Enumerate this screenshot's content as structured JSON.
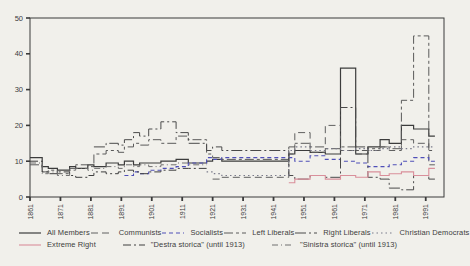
{
  "page": {
    "background": "#f1f0eb",
    "frame_color": "#3a3a3a",
    "tick_text_color": "#3d3d3d"
  },
  "chart_data": {
    "type": "line",
    "subtype": "step-after",
    "title": "",
    "xlabel": "",
    "ylabel": "",
    "xlim": [
      1861,
      1997
    ],
    "ylim": [
      0,
      50
    ],
    "x_ticks": [
      1861,
      1871,
      1881,
      1891,
      1901,
      1911,
      1921,
      1931,
      1941,
      1951,
      1961,
      1971,
      1981,
      1991
    ],
    "y_ticks": [
      0,
      10,
      20,
      30,
      40,
      50
    ],
    "grid": false,
    "legend_position": "bottom",
    "series": [
      {
        "name": "all-members",
        "label": "All Members",
        "color": "#3c3c3c",
        "dash": [],
        "width": 1.2,
        "points": [
          [
            1861,
            11
          ],
          [
            1865,
            8.5
          ],
          [
            1867,
            8
          ],
          [
            1870,
            7.5
          ],
          [
            1874,
            8.5
          ],
          [
            1876,
            8
          ],
          [
            1880,
            9
          ],
          [
            1882,
            8.5
          ],
          [
            1886,
            9.5
          ],
          [
            1890,
            9
          ],
          [
            1892,
            10
          ],
          [
            1895,
            9
          ],
          [
            1897,
            9.5
          ],
          [
            1900,
            9.5
          ],
          [
            1904,
            10
          ],
          [
            1909,
            10.5
          ],
          [
            1913,
            9.5
          ],
          [
            1919,
            10
          ],
          [
            1921,
            10.5
          ],
          [
            1924,
            10
          ],
          [
            1946,
            12
          ],
          [
            1948,
            13
          ],
          [
            1953,
            12.5
          ],
          [
            1958,
            12
          ],
          [
            1963,
            36
          ],
          [
            1968,
            12
          ],
          [
            1972,
            14
          ],
          [
            1976,
            16
          ],
          [
            1979,
            15
          ],
          [
            1983,
            20
          ],
          [
            1987,
            19
          ],
          [
            1992,
            17
          ],
          [
            1994,
            17
          ]
        ]
      },
      {
        "name": "communists",
        "label": "Communists",
        "color": "#606060",
        "dash": [
          7,
          4
        ],
        "width": 1,
        "points": [
          [
            1921,
            5
          ],
          [
            1924,
            5.5
          ],
          [
            1946,
            12
          ],
          [
            1948,
            18
          ],
          [
            1953,
            12.5
          ],
          [
            1958,
            20
          ],
          [
            1963,
            13
          ],
          [
            1968,
            12
          ],
          [
            1972,
            13
          ],
          [
            1976,
            14
          ],
          [
            1979,
            13
          ],
          [
            1983,
            16
          ],
          [
            1987,
            15
          ],
          [
            1992,
            9
          ],
          [
            1994,
            9
          ]
        ]
      },
      {
        "name": "socialists",
        "label": "Socialists",
        "color": "#4f4fb8",
        "dash": [
          4,
          3
        ],
        "width": 1.1,
        "points": [
          [
            1892,
            6
          ],
          [
            1895,
            7
          ],
          [
            1897,
            6.5
          ],
          [
            1900,
            7.5
          ],
          [
            1904,
            8
          ],
          [
            1909,
            8.5
          ],
          [
            1913,
            9.5
          ],
          [
            1919,
            11
          ],
          [
            1921,
            10.5
          ],
          [
            1924,
            11
          ],
          [
            1946,
            11
          ],
          [
            1948,
            10
          ],
          [
            1953,
            11.5
          ],
          [
            1958,
            10.5
          ],
          [
            1963,
            10
          ],
          [
            1968,
            9.5
          ],
          [
            1972,
            8.5
          ],
          [
            1976,
            8.5
          ],
          [
            1979,
            9
          ],
          [
            1983,
            10
          ],
          [
            1987,
            11
          ],
          [
            1992,
            10
          ],
          [
            1994,
            10
          ]
        ]
      },
      {
        "name": "left-liberals",
        "label": "Left Liberals",
        "color": "#5a5a5a",
        "dash": [
          9,
          3,
          3,
          3
        ],
        "width": 1,
        "points": [
          [
            1861,
            9
          ],
          [
            1865,
            7
          ],
          [
            1867,
            7.5
          ],
          [
            1870,
            6.5
          ],
          [
            1874,
            8
          ],
          [
            1876,
            9
          ],
          [
            1880,
            8.5
          ],
          [
            1882,
            12
          ],
          [
            1886,
            13
          ],
          [
            1890,
            12.5
          ],
          [
            1892,
            14
          ],
          [
            1895,
            15
          ],
          [
            1897,
            14.5
          ],
          [
            1900,
            16
          ],
          [
            1904,
            15
          ],
          [
            1909,
            17
          ],
          [
            1913,
            16
          ],
          [
            1919,
            12
          ],
          [
            1921,
            11
          ],
          [
            1924,
            10.5
          ],
          [
            1946,
            14
          ],
          [
            1948,
            15
          ],
          [
            1953,
            14
          ],
          [
            1958,
            13.5
          ],
          [
            1963,
            14
          ],
          [
            1968,
            13
          ],
          [
            1972,
            13.5
          ],
          [
            1976,
            14
          ],
          [
            1979,
            13.5
          ],
          [
            1983,
            27
          ],
          [
            1987,
            45
          ],
          [
            1992,
            13
          ],
          [
            1994,
            13
          ]
        ]
      },
      {
        "name": "right-liberals",
        "label": "Right Liberals",
        "color": "#4a4a4a",
        "dash": [
          11,
          3,
          2,
          3
        ],
        "width": 1,
        "points": [
          [
            1882,
            14
          ],
          [
            1886,
            15
          ],
          [
            1890,
            14.5
          ],
          [
            1892,
            16
          ],
          [
            1895,
            18
          ],
          [
            1897,
            17
          ],
          [
            1900,
            19
          ],
          [
            1904,
            21
          ],
          [
            1909,
            18
          ],
          [
            1913,
            15
          ],
          [
            1919,
            13
          ],
          [
            1921,
            14
          ],
          [
            1924,
            13
          ],
          [
            1946,
            6
          ],
          [
            1948,
            5
          ],
          [
            1953,
            6
          ],
          [
            1958,
            5.5
          ],
          [
            1963,
            25
          ],
          [
            1968,
            14
          ],
          [
            1972,
            5.5
          ],
          [
            1976,
            5
          ],
          [
            1979,
            2.5
          ],
          [
            1983,
            2
          ],
          [
            1987,
            6
          ],
          [
            1992,
            5
          ],
          [
            1994,
            5
          ]
        ]
      },
      {
        "name": "christian-democrats",
        "label": "Christian Democrats",
        "color": "#7a7a8a",
        "dash": [
          1.5,
          3
        ],
        "width": 1.2,
        "points": [
          [
            1919,
            7
          ],
          [
            1921,
            6.5
          ],
          [
            1924,
            6
          ],
          [
            1946,
            13
          ],
          [
            1948,
            14
          ],
          [
            1953,
            13
          ],
          [
            1958,
            13.5
          ],
          [
            1963,
            13
          ],
          [
            1968,
            13.5
          ],
          [
            1972,
            13
          ],
          [
            1976,
            13.5
          ],
          [
            1979,
            14
          ],
          [
            1983,
            13.5
          ],
          [
            1987,
            14
          ],
          [
            1992,
            14
          ],
          [
            1994,
            14
          ]
        ]
      },
      {
        "name": "extreme-right",
        "label": "Extreme Right",
        "color": "#d98f9b",
        "dash": [],
        "width": 1.1,
        "points": [
          [
            1946,
            4
          ],
          [
            1948,
            5
          ],
          [
            1953,
            6
          ],
          [
            1958,
            5
          ],
          [
            1963,
            6
          ],
          [
            1968,
            5.5
          ],
          [
            1972,
            7
          ],
          [
            1976,
            6
          ],
          [
            1979,
            6.5
          ],
          [
            1983,
            7
          ],
          [
            1987,
            6
          ],
          [
            1992,
            8
          ],
          [
            1994,
            8
          ]
        ]
      },
      {
        "name": "destra-storica",
        "label": "\"Destra storica\"  (until 1913)",
        "color": "#3f3f3f",
        "dash": [
          8,
          3,
          2,
          3
        ],
        "width": 1,
        "points": [
          [
            1861,
            10
          ],
          [
            1865,
            7
          ],
          [
            1867,
            6.5
          ],
          [
            1870,
            7
          ],
          [
            1874,
            6
          ],
          [
            1876,
            5.5
          ],
          [
            1880,
            6
          ],
          [
            1882,
            7
          ],
          [
            1886,
            6.5
          ],
          [
            1890,
            7
          ],
          [
            1892,
            7.5
          ],
          [
            1895,
            7
          ],
          [
            1897,
            6.5
          ],
          [
            1900,
            7
          ],
          [
            1904,
            7.5
          ],
          [
            1909,
            8
          ],
          [
            1913,
            8
          ],
          [
            1919,
            8
          ]
        ]
      },
      {
        "name": "sinistra-storica",
        "label": "\"Sinistra storica\"  (until 1913)",
        "color": "#707070",
        "dash": [
          6,
          3,
          1,
          3
        ],
        "width": 1,
        "points": [
          [
            1861,
            9.5
          ],
          [
            1865,
            6.5
          ],
          [
            1867,
            7
          ],
          [
            1870,
            6
          ],
          [
            1874,
            7.5
          ],
          [
            1876,
            8
          ],
          [
            1880,
            7.5
          ],
          [
            1882,
            8
          ],
          [
            1886,
            8.5
          ],
          [
            1890,
            8
          ],
          [
            1892,
            9
          ],
          [
            1895,
            8.5
          ],
          [
            1897,
            9
          ],
          [
            1900,
            8.5
          ],
          [
            1904,
            9
          ],
          [
            1909,
            9.5
          ],
          [
            1913,
            9
          ],
          [
            1919,
            9
          ]
        ]
      }
    ],
    "legend_rows": [
      [
        0,
        1,
        2,
        3,
        4,
        5
      ],
      [
        6,
        7,
        8
      ]
    ]
  }
}
